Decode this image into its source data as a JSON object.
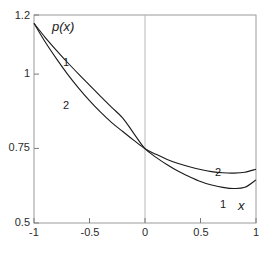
{
  "chart_data": {
    "type": "line",
    "title": "",
    "xlabel": "x",
    "ylabel": "p(x)",
    "xlim": [
      -1,
      1
    ],
    "ylim": [
      0.5,
      1.2
    ],
    "grid": false,
    "legend_position": "inline-curve-labels",
    "x_ticks": [
      {
        "value": -1,
        "label": "-1"
      },
      {
        "value": -0.5,
        "label": "-0.5"
      },
      {
        "value": 0,
        "label": "0"
      },
      {
        "value": 0.5,
        "label": "0.5"
      },
      {
        "value": 1,
        "label": "1"
      }
    ],
    "y_ticks": [
      {
        "value": 0.5,
        "label": "0.5"
      },
      {
        "value": 0.75,
        "label": "0.75"
      },
      {
        "value": 1,
        "label": "1"
      },
      {
        "value": 1.2,
        "label": "1.2"
      }
    ],
    "reference_lines": [
      {
        "axis": "x",
        "value": 0,
        "color": "#b0b0b0"
      }
    ],
    "series": [
      {
        "name": "1",
        "label": "1",
        "color": "#1a1a1a",
        "x": [
          -1.0,
          -0.9,
          -0.8,
          -0.7,
          -0.6,
          -0.5,
          -0.4,
          -0.3,
          -0.2,
          -0.1,
          0.0,
          0.1,
          0.2,
          0.3,
          0.4,
          0.5,
          0.6,
          0.7,
          0.8,
          0.9,
          1.0
        ],
        "values": [
          1.172,
          1.125,
          1.082,
          1.041,
          1.002,
          0.964,
          0.926,
          0.889,
          0.853,
          0.801,
          0.75,
          0.721,
          0.696,
          0.674,
          0.656,
          0.64,
          0.628,
          0.62,
          0.616,
          0.62,
          0.645
        ]
      },
      {
        "name": "2",
        "label": "2",
        "color": "#1a1a1a",
        "x": [
          -1.0,
          -0.9,
          -0.8,
          -0.7,
          -0.6,
          -0.5,
          -0.4,
          -0.3,
          -0.2,
          -0.1,
          0.0,
          0.1,
          0.2,
          0.3,
          0.4,
          0.5,
          0.6,
          0.7,
          0.8,
          0.9,
          1.0
        ],
        "values": [
          1.172,
          1.11,
          1.054,
          1.002,
          0.955,
          0.912,
          0.873,
          0.838,
          0.808,
          0.778,
          0.75,
          0.731,
          0.714,
          0.7,
          0.689,
          0.68,
          0.673,
          0.669,
          0.668,
          0.671,
          0.681
        ]
      }
    ],
    "series_label_positions": [
      {
        "name": "1",
        "x": -0.72,
        "y": 1.06
      },
      {
        "name": "2",
        "x": -0.72,
        "y": 0.915
      },
      {
        "name": "2",
        "x": 0.65,
        "y": 0.706
      },
      {
        "name": "1",
        "x": 0.7,
        "y": 0.598
      }
    ],
    "annotations": []
  },
  "axes": {
    "ylabel_text": "p(x)",
    "xlabel_text": "x"
  }
}
